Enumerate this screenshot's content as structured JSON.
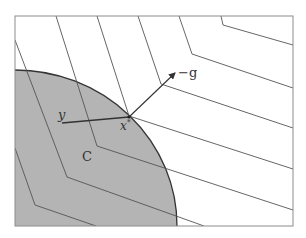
{
  "figure": {
    "type": "geometric-optimality-diagram",
    "frame": {
      "x": 15,
      "y": 16,
      "width": 278,
      "height": 210,
      "stroke": "#8c8c8c"
    },
    "set": {
      "label": "C",
      "fill": "#b4b4b4",
      "stroke": "#333333",
      "ellipse": {
        "cx": 15,
        "cy": 226,
        "rx": 162,
        "ry": 156
      }
    },
    "level_sets": {
      "stroke": "#555555",
      "chevrons": [
        {
          "points": "221,16 223,25 293,45"
        },
        {
          "points": "179,16 192,54 293,88"
        },
        {
          "points": "138,16 161,84 293,128"
        },
        {
          "points": "97,16 129,116 293,169"
        },
        {
          "points": "56,16 97,146 293,210"
        },
        {
          "points": "15,40 67,177 204,226"
        },
        {
          "points": "15,148 35,205 96,226"
        }
      ]
    },
    "points": {
      "x_star": {
        "label": "x*",
        "x": 129,
        "y": 117
      },
      "y": {
        "label": "y",
        "x": 62,
        "y": 123
      }
    },
    "vectors": {
      "neg_gradient": {
        "label": "−g",
        "x1": 129,
        "y1": 117,
        "x2": 175,
        "y2": 73
      }
    },
    "labels": {
      "C": "C",
      "y": "y",
      "x": "x",
      "star": "*",
      "neg_g": "−g"
    }
  }
}
